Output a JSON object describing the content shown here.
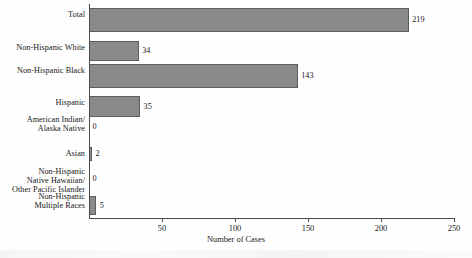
{
  "chart_data": {
    "type": "bar",
    "orientation": "horizontal",
    "title": "",
    "xlabel": "Number of Cases",
    "ylabel": "",
    "xlim": [
      0,
      250
    ],
    "xticks": [
      0,
      50,
      100,
      150,
      200,
      250
    ],
    "xtick_labels": [
      "",
      "50",
      "100",
      "150",
      "200",
      "250"
    ],
    "grid": false,
    "legend": null,
    "bar_color": "#8a8a8a",
    "bar_edge_color": "#5d5d5d",
    "categories": [
      "Total",
      "Non-Hispanic White",
      "Non-Hispanic Black",
      "Hispanic",
      "American Indian/\nAlaska Native",
      "Asian",
      "Non-Hispanic\nNative Hawaiian/\nOther Pacific Islander",
      "Non-Hispanic\nMultiple Races"
    ],
    "values": [
      219,
      34,
      143,
      35,
      0,
      2,
      0,
      5
    ],
    "value_labels": [
      "219",
      "34",
      "143",
      "35",
      "0",
      "2",
      "0",
      "5"
    ]
  }
}
